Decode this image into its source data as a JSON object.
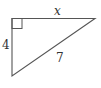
{
  "diagram": {
    "type": "right-triangle",
    "labels": {
      "top_side": "x",
      "left_side": "4",
      "hypotenuse": "7"
    },
    "colors": {
      "stroke": "#555555",
      "text": "#333333"
    }
  }
}
